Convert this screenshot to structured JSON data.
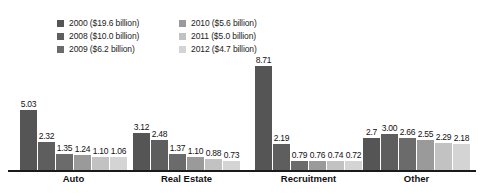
{
  "chart_data": {
    "type": "bar",
    "title": "",
    "subtitle": "",
    "xlabel": "",
    "ylabel": "",
    "ylim": [
      0,
      9.2
    ],
    "grid": false,
    "legend_position": "top",
    "categories": [
      "Auto",
      "Real Estate",
      "Recruitment",
      "Other"
    ],
    "series": [
      {
        "name": "2000",
        "legend_label": "2000 ($19.6 billion)",
        "color": "#555555",
        "values": [
          5.03,
          3.12,
          8.71,
          2.7
        ]
      },
      {
        "name": "2008",
        "legend_label": "2008 ($10.0 billion)",
        "color": "#5e5e5e",
        "values": [
          2.32,
          2.48,
          2.19,
          3.0
        ]
      },
      {
        "name": "2009",
        "legend_label": "2009 ($6.2 billion)",
        "color": "#6b6b6b",
        "values": [
          1.35,
          1.37,
          0.79,
          2.66
        ]
      },
      {
        "name": "2010",
        "legend_label": "2010 ($5.6 billion)",
        "color": "#9a9a9a",
        "values": [
          1.24,
          1.1,
          0.76,
          2.55
        ]
      },
      {
        "name": "2011",
        "legend_label": "2011 ($5.0 billion)",
        "color": "#c2c2c2",
        "values": [
          1.1,
          0.88,
          0.74,
          2.29
        ]
      },
      {
        "name": "2012",
        "legend_label": "2012 ($4.7 billion)",
        "color": "#d4d4d4",
        "values": [
          1.06,
          0.73,
          0.72,
          2.18
        ]
      }
    ],
    "value_labels": {
      "Auto": [
        "5.03",
        "2.32",
        "1.35",
        "1.24",
        "1.10",
        "1.06"
      ],
      "Real Estate": [
        "3.12",
        "2.48",
        "1.37",
        "1.10",
        "0.88",
        "0.73"
      ],
      "Recruitment": [
        "8.71",
        "2.19",
        "0.79",
        "0.76",
        "0.74",
        "0.72"
      ],
      "Other": [
        "2.7",
        "3.00",
        "2.66",
        "2.55",
        "2.29",
        "2.18"
      ]
    }
  },
  "legend": {
    "items": [
      {
        "label": "2000 ($19.6 billion)",
        "color": "#555555"
      },
      {
        "label": "2010 ($5.6 billion)",
        "color": "#9a9a9a"
      },
      {
        "label": "2008 ($10.0 billion)",
        "color": "#5e5e5e"
      },
      {
        "label": "2011 ($5.0 billion)",
        "color": "#c2c2c2"
      },
      {
        "label": "2009 ($6.2 billion)",
        "color": "#6b6b6b"
      },
      {
        "label": "2012 ($4.7 billion)",
        "color": "#d4d4d4"
      }
    ]
  },
  "axis": {
    "baseline_color": "#1a1a1a",
    "category_labels": [
      "Auto",
      "Real Estate",
      "Recruitment",
      "Other"
    ]
  }
}
